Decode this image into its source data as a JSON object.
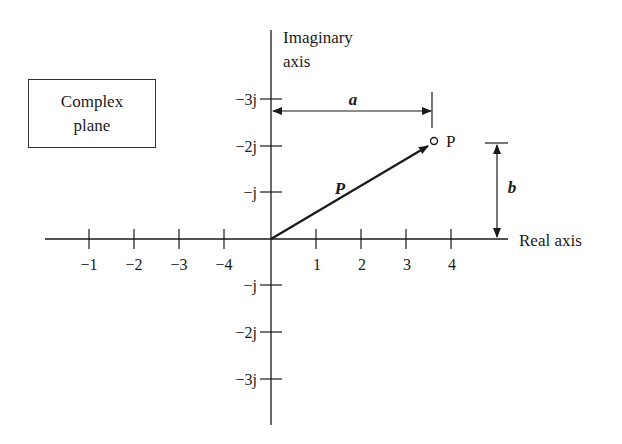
{
  "diagram": {
    "type": "complex-plane",
    "box_label_line1": "Complex",
    "box_label_line2": "plane",
    "imag_axis_label_line1": "Imaginary",
    "imag_axis_label_line2": "axis",
    "real_axis_label": "Real axis",
    "point_label": "P",
    "vector_label": "P",
    "dim_a_label": "a",
    "dim_b_label": "b",
    "real_ticks_left": [
      "−1",
      "−2",
      "−3",
      "−4"
    ],
    "real_ticks_right": [
      "1",
      "2",
      "3",
      "4"
    ],
    "imag_ticks_upper": [
      "−3j",
      "−2j",
      "−j"
    ],
    "imag_ticks_lower": [
      "−j",
      "−2j",
      "−3j"
    ]
  }
}
